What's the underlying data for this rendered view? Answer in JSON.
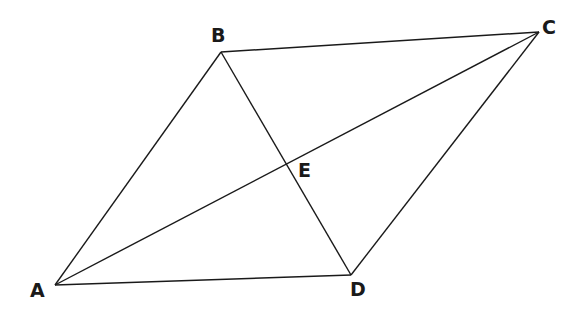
{
  "diagram": {
    "type": "parallelogram-with-diagonals",
    "points": {
      "A": {
        "label": "A",
        "x": 55,
        "y": 285,
        "lx": 30,
        "ly": 297
      },
      "B": {
        "label": "B",
        "x": 221,
        "y": 52,
        "lx": 211,
        "ly": 42
      },
      "C": {
        "label": "C",
        "x": 539,
        "y": 32,
        "lx": 542,
        "ly": 34
      },
      "D": {
        "label": "D",
        "x": 351,
        "y": 275,
        "lx": 350,
        "ly": 296
      },
      "E": {
        "label": "E",
        "x": 286,
        "y": 164,
        "lx": 298,
        "ly": 177
      }
    },
    "segments": [
      {
        "name": "side-ab",
        "from": "A",
        "to": "B"
      },
      {
        "name": "side-bc",
        "from": "B",
        "to": "C"
      },
      {
        "name": "side-cd",
        "from": "C",
        "to": "D"
      },
      {
        "name": "side-da",
        "from": "D",
        "to": "A"
      },
      {
        "name": "diagonal-ac",
        "from": "A",
        "to": "C"
      },
      {
        "name": "diagonal-bd",
        "from": "B",
        "to": "D"
      }
    ],
    "line_color": "#1a1a1a"
  }
}
